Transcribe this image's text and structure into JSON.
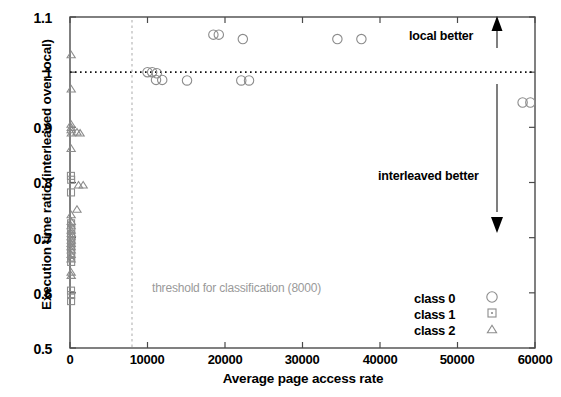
{
  "chart_data": {
    "type": "scatter",
    "title": "",
    "xlabel": "Average page access rate",
    "ylabel": "Execution time ratio (interleaved over local)",
    "xlim": [
      0,
      60000
    ],
    "ylim": [
      0.5,
      1.1
    ],
    "xticks": [
      "0",
      "10000",
      "20000",
      "30000",
      "40000",
      "50000",
      "60000"
    ],
    "xtick_values": [
      0,
      10000,
      20000,
      30000,
      40000,
      50000,
      60000
    ],
    "yticks": [
      "0.5",
      "0.6",
      "0.7",
      "0.8",
      "0.9",
      "1",
      "1.1"
    ],
    "ytick_values": [
      0.5,
      0.6,
      0.7,
      0.8,
      0.9,
      1.0,
      1.1
    ],
    "grid": false,
    "legend_position": "bottom-right",
    "reference_lines": [
      {
        "name": "unity-ratio-line",
        "orientation": "horizontal",
        "value": 1.0,
        "style": "dotted"
      },
      {
        "name": "threshold-line",
        "orientation": "vertical",
        "value": 8000,
        "style": "dashed",
        "label": "threshold for classification (8000)"
      }
    ],
    "annotations": [
      {
        "text": "local better",
        "x": 44000,
        "y": 1.072,
        "arrow": "up"
      },
      {
        "text": "interleaved better",
        "x": 44000,
        "y": 0.805,
        "arrow": "down"
      }
    ],
    "series": [
      {
        "name": "class 0",
        "marker": "circle",
        "color": "#8c8c8c",
        "points": [
          [
            10000,
            1.0
          ],
          [
            10600,
            1.0
          ],
          [
            11200,
            0.998
          ],
          [
            11100,
            0.986
          ],
          [
            11900,
            0.986
          ],
          [
            15100,
            0.985
          ],
          [
            18500,
            1.068
          ],
          [
            19200,
            1.068
          ],
          [
            22300,
            1.06
          ],
          [
            22100,
            0.985
          ],
          [
            23100,
            0.985
          ],
          [
            34500,
            1.06
          ],
          [
            37600,
            1.06
          ],
          [
            58400,
            0.945
          ],
          [
            59400,
            0.945
          ]
        ]
      },
      {
        "name": "class 1",
        "marker": "square",
        "color": "#8c8c8c",
        "points": [
          [
            120,
            0.812
          ],
          [
            150,
            0.805
          ],
          [
            130,
            0.782
          ],
          [
            140,
            0.726
          ],
          [
            160,
            0.716
          ],
          [
            130,
            0.706
          ],
          [
            150,
            0.7
          ],
          [
            140,
            0.694
          ],
          [
            160,
            0.686
          ],
          [
            130,
            0.68
          ],
          [
            150,
            0.672
          ],
          [
            140,
            0.664
          ],
          [
            150,
            0.656
          ],
          [
            130,
            0.604
          ],
          [
            150,
            0.596
          ],
          [
            140,
            0.585
          ]
        ]
      },
      {
        "name": "class 2",
        "marker": "triangle",
        "color": "#8c8c8c",
        "points": [
          [
            150,
            1.032
          ],
          [
            160,
            0.97
          ],
          [
            140,
            0.906
          ],
          [
            160,
            0.9
          ],
          [
            150,
            0.896
          ],
          [
            170,
            0.89
          ],
          [
            900,
            0.892
          ],
          [
            1300,
            0.89
          ],
          [
            150,
            0.862
          ],
          [
            1100,
            0.796
          ],
          [
            1700,
            0.796
          ],
          [
            900,
            0.752
          ],
          [
            150,
            0.742
          ],
          [
            160,
            0.73
          ],
          [
            140,
            0.722
          ],
          [
            150,
            0.714
          ],
          [
            170,
            0.708
          ],
          [
            140,
            0.702
          ],
          [
            160,
            0.696
          ],
          [
            150,
            0.69
          ],
          [
            140,
            0.684
          ],
          [
            160,
            0.678
          ],
          [
            150,
            0.67
          ],
          [
            140,
            0.662
          ],
          [
            150,
            0.638
          ],
          [
            160,
            0.632
          ]
        ]
      }
    ]
  },
  "legend": {
    "items": [
      {
        "label": "class 0",
        "marker": "circle"
      },
      {
        "label": "class 1",
        "marker": "square"
      },
      {
        "label": "class 2",
        "marker": "triangle"
      }
    ]
  }
}
